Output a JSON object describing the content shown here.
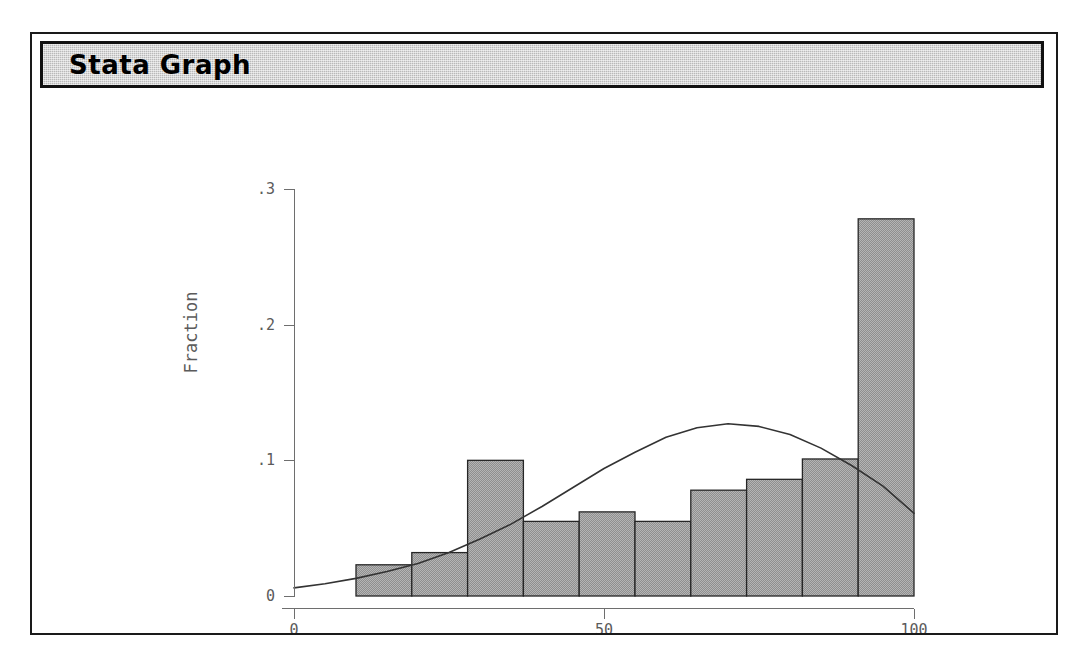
{
  "window": {
    "title": "Stata Graph",
    "frame_color": "#1a1a1a",
    "titlebar_color": "#b9b9b9"
  },
  "chart_data": {
    "type": "bar",
    "title": "",
    "subtitle": "",
    "xlabel": "Adult Literacy Rate (%) 1985",
    "ylabel": "Fraction",
    "xlim": [
      0,
      100
    ],
    "ylim": [
      0,
      0.3
    ],
    "x_ticks": [
      0,
      50,
      100
    ],
    "x_tick_labels": [
      "0",
      "50",
      "100"
    ],
    "y_ticks": [
      0,
      0.1,
      0.2,
      0.3
    ],
    "y_tick_labels": [
      "0",
      ".1",
      ".2",
      ".3"
    ],
    "grid": false,
    "legend": "none",
    "bar_fill_color": "#9a9a9a",
    "bar_edge_color": "#262626",
    "bin_edges": [
      10,
      19,
      28,
      37,
      46,
      55,
      64,
      73,
      82,
      91,
      100
    ],
    "categories": [
      "10-19",
      "19-28",
      "28-37",
      "37-46",
      "46-55",
      "55-64",
      "64-73",
      "73-82",
      "82-91",
      "91-100"
    ],
    "values": [
      0.023,
      0.032,
      0.1,
      0.055,
      0.062,
      0.055,
      0.078,
      0.086,
      0.101,
      0.278
    ],
    "overlay": {
      "name": "normal density",
      "type": "line",
      "color": "#333333",
      "x": [
        0,
        5,
        10,
        15,
        20,
        25,
        30,
        35,
        40,
        45,
        50,
        55,
        60,
        65,
        70,
        75,
        80,
        85,
        90,
        95,
        100
      ],
      "y": [
        0.006,
        0.009,
        0.013,
        0.018,
        0.024,
        0.032,
        0.042,
        0.053,
        0.066,
        0.08,
        0.094,
        0.106,
        0.117,
        0.124,
        0.127,
        0.125,
        0.119,
        0.109,
        0.096,
        0.081,
        0.061
      ]
    }
  }
}
